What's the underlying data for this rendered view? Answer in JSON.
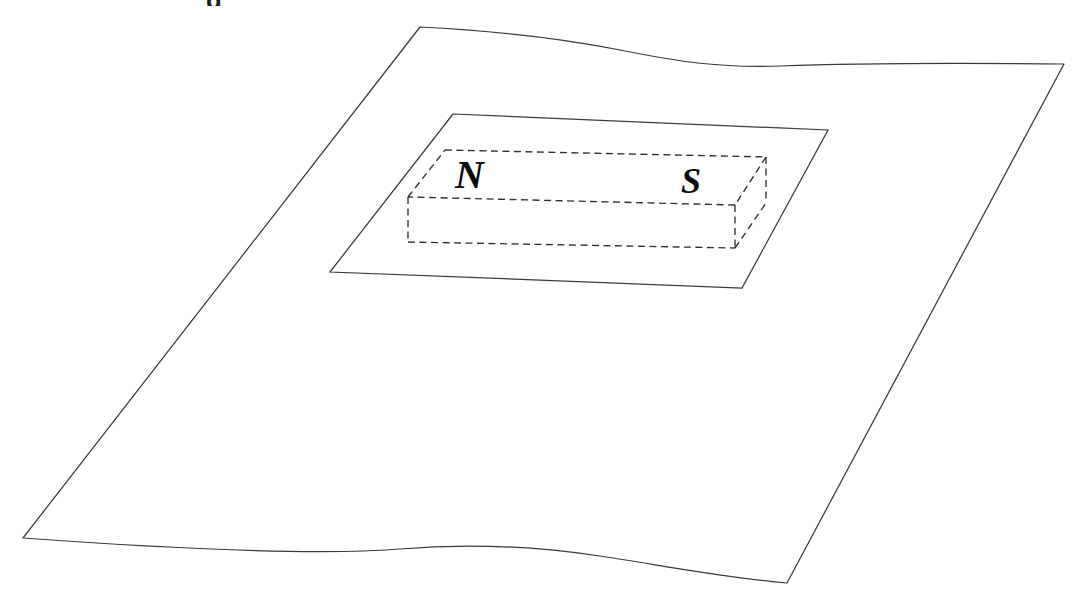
{
  "figure": {
    "kind": "physics-diagram",
    "background_color": "#ffffff",
    "line_color": "#3a3a3a",
    "label_color": "#0b0b0b",
    "width": 1078,
    "height": 592
  },
  "caption": {
    "visible_fragment": "g",
    "note": "top caption line is cropped off above the image edge; only the bottom of one bold glyph remains"
  },
  "sheet": {
    "name": "flexible sheet",
    "corners": {
      "top_left": [
        420,
        27
      ],
      "top_right": [
        1064,
        64
      ],
      "bottom_right": [
        787,
        583
      ],
      "bottom_left": [
        23,
        538
      ]
    },
    "stroke": "#3a3a3a",
    "fill": "#ffffff"
  },
  "loop": {
    "name": "rectangular loop area",
    "corners": {
      "top_left": [
        453,
        114
      ],
      "top_right": [
        828,
        130
      ],
      "bottom_right": [
        742,
        288
      ],
      "bottom_left": [
        330,
        272
      ]
    },
    "stroke": "#3a3a3a"
  },
  "magnet": {
    "name": "bar magnet",
    "style": "dashed hidden-line box",
    "stroke": "#2f2f2f",
    "dash": "7 4.5",
    "top_face": {
      "back_left": [
        445,
        150
      ],
      "back_right": [
        766,
        157
      ],
      "front_right": [
        735,
        205
      ],
      "front_left": [
        408,
        197
      ]
    },
    "bottom_front": {
      "front_left": [
        408,
        242
      ],
      "front_right": [
        735,
        248
      ]
    },
    "back_right_bottom": [
      766,
      203
    ],
    "poles": [
      {
        "label": "N",
        "name": "north-pole-label",
        "x": 455,
        "y": 188,
        "font_size": 40
      },
      {
        "label": "S",
        "name": "south-pole-label",
        "x": 681,
        "y": 193,
        "font_size": 36
      }
    ]
  }
}
